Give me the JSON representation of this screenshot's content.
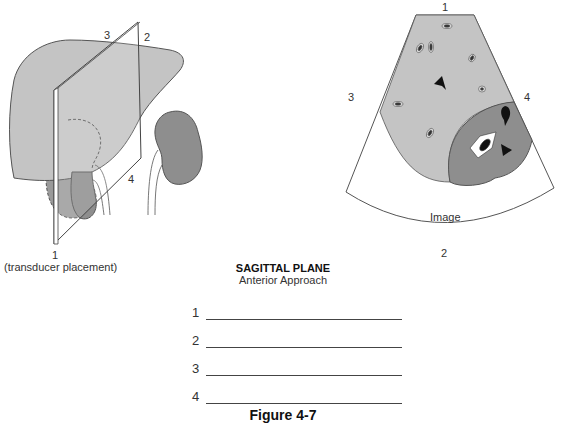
{
  "diagram": {
    "left_figure": {
      "labels": {
        "p1": "1",
        "p2": "2",
        "p3": "3",
        "p4": "4",
        "note": "(transducer placement)"
      }
    },
    "right_figure": {
      "labels": {
        "p1": "1",
        "p2": "2",
        "p3": "3",
        "p4": "4",
        "image": "Image"
      }
    },
    "caption": {
      "title": "SAGITTAL PLANE",
      "subtitle": "Anterior Approach"
    },
    "answers": [
      {
        "number": "1",
        "value": ""
      },
      {
        "number": "2",
        "value": ""
      },
      {
        "number": "3",
        "value": ""
      },
      {
        "number": "4",
        "value": ""
      }
    ],
    "figure_label": "Figure 4-7",
    "colors": {
      "liver": "#c4c4c4",
      "kidney": "#8e8e8e",
      "outline": "#555555",
      "plane": "#ffffff"
    }
  }
}
